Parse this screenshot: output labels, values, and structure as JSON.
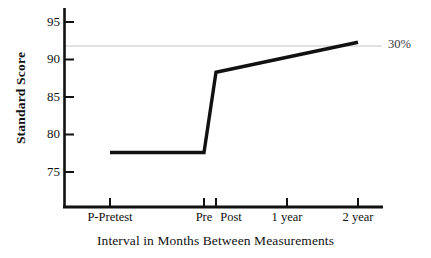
{
  "chart_data": {
    "type": "line",
    "title": "",
    "xlabel": "Interval in Months Between Measurements",
    "ylabel": "Standard Score",
    "categories": [
      "P-Pretest",
      "Pre",
      "Post",
      "1 year",
      "2 year"
    ],
    "values": [
      77.6,
      77.6,
      88.3,
      90.3,
      92.3
    ],
    "series": [
      {
        "name": "Standard Score",
        "values": [
          77.6,
          77.6,
          88.3,
          90.3,
          92.3
        ],
        "color": "#111111"
      }
    ],
    "ylim": [
      71.5,
      96.5
    ],
    "yticks": [
      75,
      80,
      85,
      90,
      95
    ],
    "ytick_labels": [
      "75",
      "80",
      "85",
      "90",
      "95"
    ],
    "xtick_labels": [
      "P-Pretest",
      "Pre",
      "Post",
      "1 year",
      "2 year"
    ],
    "grid": false,
    "legend": "none",
    "annotations": [
      {
        "name": "percentile-reference-line",
        "label": "30%",
        "value": 91.8,
        "color": "#d8d8d8",
        "style": "horizontal-line"
      }
    ]
  },
  "axes": {
    "y_axis_title": "Standard Score",
    "x_axis_title": "Interval in Months Between Measurements",
    "y_ticks": [
      {
        "label": "95",
        "value": 95
      },
      {
        "label": "90",
        "value": 90
      },
      {
        "label": "85",
        "value": 85
      },
      {
        "label": "80",
        "value": 80
      },
      {
        "label": "75",
        "value": 75
      }
    ],
    "x_ticks": [
      {
        "label": "P-Pretest",
        "value": 77.6
      },
      {
        "label": "Pre",
        "value": 77.6
      },
      {
        "label": "Post",
        "value": 88.3
      },
      {
        "label": "1 year",
        "value": 90.3
      },
      {
        "label": "2 year",
        "value": 92.3
      }
    ]
  },
  "reference": {
    "label": "30%"
  },
  "colors": {
    "line": "#111111",
    "axis": "#111111",
    "reference_line": "#d8d8d8",
    "background": "#ffffff",
    "text": "#111111"
  }
}
